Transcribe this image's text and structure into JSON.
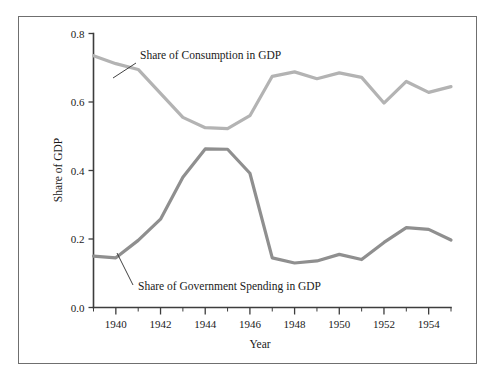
{
  "chart_data": {
    "type": "line",
    "title": "",
    "xlabel": "Year",
    "ylabel": "Share of GDP",
    "xlim": [
      1939,
      1955
    ],
    "ylim": [
      0.0,
      0.8
    ],
    "grid": false,
    "legend_position": "inline-annotations",
    "x": [
      1939,
      1940,
      1941,
      1942,
      1943,
      1944,
      1945,
      1946,
      1947,
      1948,
      1949,
      1950,
      1951,
      1952,
      1953,
      1954,
      1955
    ],
    "xtick_labels_major": [
      "1940",
      "1942",
      "1944",
      "1946",
      "1948",
      "1950",
      "1952",
      "1954"
    ],
    "xtick_values_major": [
      1940,
      1942,
      1944,
      1946,
      1948,
      1950,
      1952,
      1954
    ],
    "xtick_values_minor": [
      1939,
      1941,
      1943,
      1945,
      1947,
      1949,
      1951,
      1953,
      1955
    ],
    "ytick_labels": [
      "0.8",
      "0.6",
      "0.4",
      "0.2",
      "0.0"
    ],
    "ytick_values": [
      0.8,
      0.6,
      0.4,
      0.2,
      0.0
    ],
    "series": [
      {
        "name": "Share of Consumption in GDP",
        "color": "#b3b3b3",
        "values": [
          0.735,
          0.712,
          0.695,
          0.625,
          0.555,
          0.525,
          0.522,
          0.56,
          0.675,
          0.688,
          0.668,
          0.685,
          0.672,
          0.597,
          0.66,
          0.628,
          0.645
        ]
      },
      {
        "name": "Share of Government Spending in GDP",
        "color": "#8f8f8f",
        "values": [
          0.15,
          0.145,
          0.196,
          0.258,
          0.38,
          0.463,
          0.462,
          0.392,
          0.145,
          0.13,
          0.136,
          0.155,
          0.14,
          0.19,
          0.233,
          0.228,
          0.197
        ]
      }
    ],
    "annotations": [
      {
        "text": "Share of Consumption in GDP",
        "label_x": 140,
        "label_y": 59,
        "leader": [
          [
            136,
            63
          ],
          [
            113,
            78
          ]
        ]
      },
      {
        "text": "Share of Government Spending in GDP",
        "label_x": 138,
        "label_y": 290,
        "leader": [
          [
            133,
            285
          ],
          [
            117,
            253
          ]
        ]
      }
    ]
  },
  "axes": {
    "x_axis_title": "Year",
    "y_axis_title": "Share of GDP"
  },
  "colors": {
    "consumption_line": "#b3b3b3",
    "government_line": "#8f8f8f",
    "axis": "#3d3d3d",
    "frame_border": "#6f6f6f",
    "text": "#1a1a1a",
    "background": "#ffffff"
  }
}
